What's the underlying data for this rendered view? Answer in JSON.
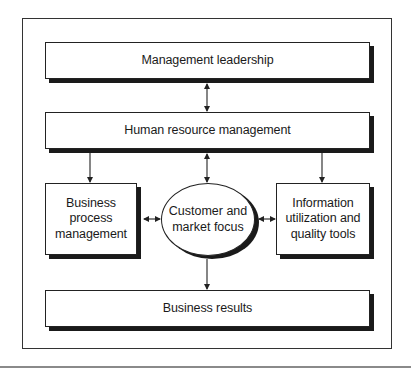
{
  "diagram": {
    "nodes": {
      "management_leadership": {
        "label": "Management leadership",
        "shape": "rectangle"
      },
      "human_resource_management": {
        "label": "Human resource management",
        "shape": "rectangle"
      },
      "business_process_management": {
        "label": "Business\nprocess\nmanagement",
        "shape": "rectangle"
      },
      "customer_market_focus": {
        "label": "Customer and\nmarket focus",
        "shape": "ellipse"
      },
      "information_utilization": {
        "label": "Information\nutilization and\nquality tools",
        "shape": "rectangle"
      },
      "business_results": {
        "label": "Business results",
        "shape": "rectangle"
      }
    },
    "edges": [
      {
        "from": "management_leadership",
        "to": "human_resource_management",
        "type": "bidirectional"
      },
      {
        "from": "human_resource_management",
        "to": "business_process_management",
        "type": "directed"
      },
      {
        "from": "human_resource_management",
        "to": "customer_market_focus",
        "type": "bidirectional"
      },
      {
        "from": "human_resource_management",
        "to": "information_utilization",
        "type": "directed"
      },
      {
        "from": "business_process_management",
        "to": "customer_market_focus",
        "type": "bidirectional"
      },
      {
        "from": "customer_market_focus",
        "to": "information_utilization",
        "type": "bidirectional"
      },
      {
        "from": "customer_market_focus",
        "to": "business_results",
        "type": "directed"
      }
    ],
    "colors": {
      "stroke": "#222222",
      "shadow": "#1a1a1a",
      "fill": "#ffffff",
      "rule": "#8a8a8a"
    }
  }
}
